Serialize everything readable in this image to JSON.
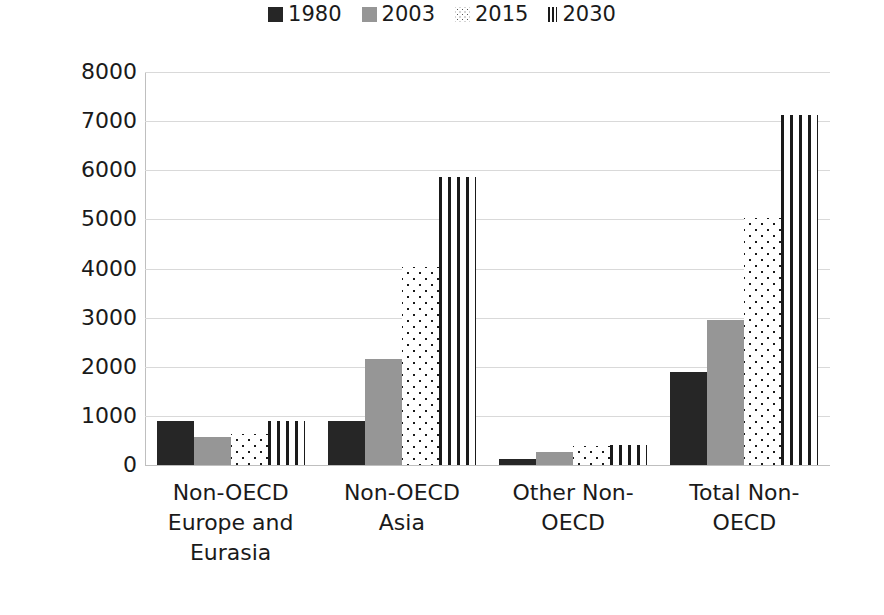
{
  "chart_data": {
    "type": "bar",
    "title": "",
    "subtitle": "",
    "xlabel": "",
    "ylabel": "",
    "ylim": [
      0,
      8000
    ],
    "ytick_step": 1000,
    "grid": true,
    "legend_position": "top-center",
    "categories": [
      "Non-OECD Europe and Eurasia",
      "Non-OECD Asia",
      "Other Non-OECD",
      "Total Non-OECD"
    ],
    "category_label_lines": [
      [
        "Non-OECD",
        "Europe and",
        "Eurasia"
      ],
      [
        "Non-OECD",
        "Asia"
      ],
      [
        "Other Non-",
        "OECD"
      ],
      [
        "Total Non-",
        "OECD"
      ]
    ],
    "ytick_labels": [
      "8000",
      "7000",
      "6000",
      "5000",
      "4000",
      "3000",
      "2000",
      "1000",
      "0"
    ],
    "ytick_values": [
      8000,
      7000,
      6000,
      5000,
      4000,
      3000,
      2000,
      1000,
      0
    ],
    "series": [
      {
        "name": "1980",
        "fill": "solid-dark",
        "color": "#262626",
        "values": [
          900,
          900,
          130,
          1900
        ]
      },
      {
        "name": "2003",
        "fill": "solid-gray",
        "color": "#969696",
        "values": [
          570,
          2150,
          270,
          2950
        ]
      },
      {
        "name": "2015",
        "fill": "dotted",
        "color": "#ffffff",
        "values": [
          630,
          4030,
          380,
          5030
        ]
      },
      {
        "name": "2030",
        "fill": "vertical-stripes",
        "color": "#ffffff",
        "values": [
          900,
          5860,
          400,
          7130
        ]
      }
    ]
  },
  "legend": {
    "entries": [
      {
        "label": "1980",
        "swatch": "legend-swatch-1980"
      },
      {
        "label": "2003",
        "swatch": "legend-swatch-2003"
      },
      {
        "label": "2015",
        "swatch": "legend-swatch-2015"
      },
      {
        "label": "2030",
        "swatch": "legend-swatch-2030"
      }
    ]
  },
  "colors": {
    "series_1980": "#262626",
    "series_2003": "#969696",
    "series_2015_bg": "#ffffff",
    "series_2015_dot": "#1a1a1a",
    "series_2030_bg": "#ffffff",
    "series_2030_stripe": "#1a1a1a",
    "gridline": "#d9d9d9",
    "axis": "#bfbfbf",
    "text": "#1a1a1a",
    "background": "#ffffff"
  }
}
